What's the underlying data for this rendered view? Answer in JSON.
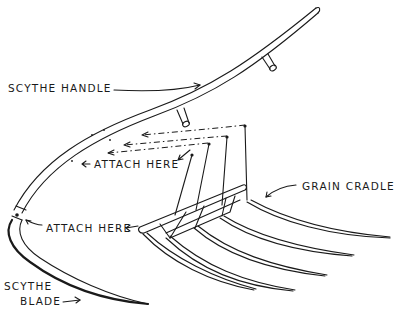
{
  "diagram": {
    "labels": {
      "scythe_handle": "SCYTHE HANDLE",
      "attach_here_upper": "ATTACH HERE",
      "attach_here_lower": "ATTACH HERE",
      "grain_cradle": "GRAIN CRADLE",
      "scythe_blade_line1": "SCYTHE",
      "scythe_blade_line2": "BLADE"
    },
    "parts": [
      "scythe-handle",
      "handle-grips",
      "scythe-blade",
      "grain-cradle",
      "cradle-fingers",
      "attachment-wires"
    ],
    "colors": {
      "ink": "#1a1a1a",
      "background": "#ffffff"
    }
  }
}
